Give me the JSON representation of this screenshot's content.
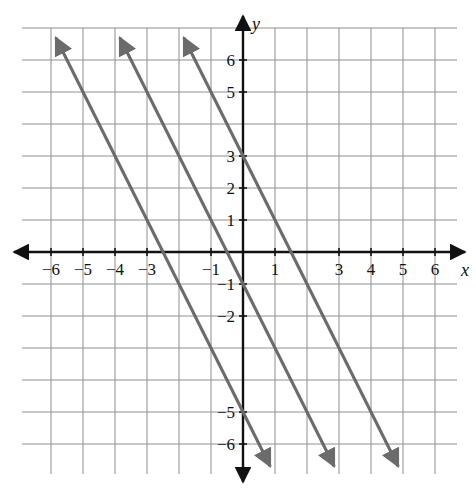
{
  "figure": {
    "kind": "coordinate-plane",
    "background_color": "#ffffff",
    "grid_color": "#8e8e8e",
    "axis_color": "#111111",
    "line_color": "#6b6b6b",
    "label_color": "#111111"
  },
  "axes": {
    "x_axis_name": "x",
    "y_axis_name": "y",
    "x_min": -7,
    "x_max": 7,
    "y_min": -7,
    "y_max": 7,
    "grid": true,
    "grid_step": 1,
    "arrows": [
      "left",
      "right",
      "up",
      "down"
    ]
  },
  "x_tick_labels": [
    {
      "value": -6,
      "text": "−6"
    },
    {
      "value": -5,
      "text": "−5"
    },
    {
      "value": -4,
      "text": "−4"
    },
    {
      "value": -3,
      "text": "−3"
    },
    {
      "value": -1,
      "text": "−1"
    },
    {
      "value": 1,
      "text": "1"
    },
    {
      "value": 3,
      "text": "3"
    },
    {
      "value": 4,
      "text": "4"
    },
    {
      "value": 5,
      "text": "5"
    },
    {
      "value": 6,
      "text": "6"
    }
  ],
  "y_tick_labels": [
    {
      "value": 6,
      "text": "6"
    },
    {
      "value": 5,
      "text": "5"
    },
    {
      "value": 3,
      "text": "3"
    },
    {
      "value": 2,
      "text": "2"
    },
    {
      "value": 1,
      "text": "1"
    },
    {
      "value": -1,
      "text": "−1"
    },
    {
      "value": -2,
      "text": "−2"
    },
    {
      "value": -5,
      "text": "−5"
    },
    {
      "value": -6,
      "text": "−6"
    }
  ],
  "chart_data": {
    "type": "line",
    "title": "",
    "subtitle": "",
    "xlabel": "x",
    "ylabel": "y",
    "xlim": [
      -7,
      7
    ],
    "ylim": [
      -7,
      7
    ],
    "grid": true,
    "legend": "none",
    "annotations": [],
    "series": [
      {
        "name": "line-1",
        "slope": -2,
        "y_intercept": 3,
        "x_intercept": 1.5,
        "equation": "y = -2x + 3",
        "color": "#6b6b6b",
        "arrow_start": true,
        "arrow_end": true,
        "x": [
          -1.85,
          4.85
        ],
        "values": [
          6.7,
          -6.7
        ]
      },
      {
        "name": "line-2",
        "slope": -2,
        "y_intercept": -1,
        "x_intercept": -0.5,
        "equation": "y = -2x - 1",
        "color": "#6b6b6b",
        "arrow_start": true,
        "arrow_end": true,
        "x": [
          -3.85,
          2.85
        ],
        "values": [
          6.7,
          -6.7
        ]
      },
      {
        "name": "line-3",
        "slope": -2,
        "y_intercept": -5,
        "x_intercept": -2.5,
        "equation": "y = -2x - 5",
        "color": "#6b6b6b",
        "arrow_start": true,
        "arrow_end": true,
        "x": [
          -5.85,
          0.85
        ],
        "values": [
          6.7,
          -6.7
        ]
      }
    ]
  }
}
